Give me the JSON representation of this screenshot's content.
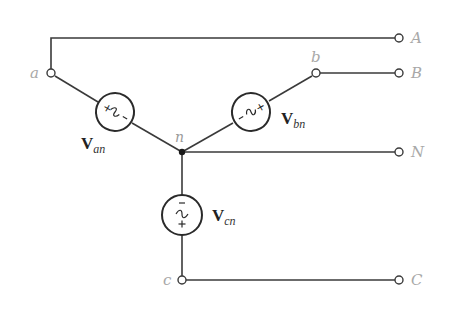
{
  "diagram": {
    "type": "three-phase wye-connected source",
    "nodes": {
      "a": "a",
      "b": "b",
      "c": "c",
      "n": "n"
    },
    "terminals": {
      "A": "A",
      "B": "B",
      "N": "N",
      "C": "C"
    },
    "sources": [
      {
        "id": "an",
        "label_main": "V",
        "label_sub": "an"
      },
      {
        "id": "bn",
        "label_main": "V",
        "label_sub": "bn"
      },
      {
        "id": "cn",
        "label_main": "V",
        "label_sub": "cn"
      }
    ],
    "source_symbols": {
      "plus": "+",
      "minus": "−",
      "tilde": "~"
    },
    "colors": {
      "wire": "#3a3a3a",
      "terminal_label": "#a8a8a8",
      "source_label": "#222222"
    }
  }
}
